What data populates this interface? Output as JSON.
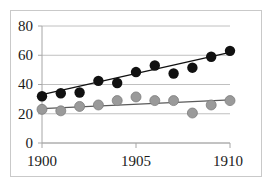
{
  "chart_data": {
    "type": "scatter",
    "title": "",
    "subtitle": "",
    "xlabel": "",
    "ylabel": "",
    "x": [
      1900,
      1901,
      1902,
      1903,
      1904,
      1905,
      1906,
      1907,
      1908,
      1909,
      1910
    ],
    "xlim": [
      1900,
      1910
    ],
    "ylim": [
      0,
      80
    ],
    "xticks": [
      1900,
      1905,
      1910
    ],
    "xtick_labels": [
      "1900",
      "1905",
      "1910"
    ],
    "yticks": [
      0,
      20,
      40,
      60,
      80
    ],
    "ytick_labels": [
      "0",
      "20",
      "40",
      "60",
      "80"
    ],
    "grid": "horizontal",
    "legend": "none",
    "series": [
      {
        "name": "black-series",
        "marker": "filled-circle",
        "color": "#111111",
        "values": [
          32,
          34,
          34.5,
          42.5,
          41,
          48.5,
          53,
          47.5,
          51.5,
          59,
          63
        ],
        "trendline": {
          "y_start": 33,
          "y_end": 62,
          "color": "#111111"
        }
      },
      {
        "name": "grey-series",
        "marker": "filled-circle",
        "color": "#9a9a9a",
        "values": [
          23,
          22,
          25,
          26,
          29,
          31.5,
          29,
          29,
          20.5,
          26,
          29
        ],
        "trendline": {
          "y_start": 23.5,
          "y_end": 29.5,
          "color": "#5a5a5a"
        }
      }
    ],
    "colors": {
      "gridline": "#c0c0c0",
      "axis": "#a6a6a6",
      "frame": "#c9c9c9",
      "text": "#1a1a1a",
      "background": "#ffffff"
    }
  },
  "axis_labels": {
    "y80": "80",
    "y60": "60",
    "y40": "40",
    "y20": "20",
    "y0": "0",
    "x1900": "1900",
    "x1905": "1905",
    "x1910": "1910"
  }
}
